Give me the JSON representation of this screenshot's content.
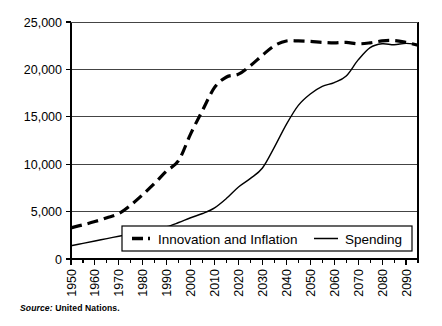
{
  "source_note": {
    "prefix": "Source:",
    "text": "United Nations."
  },
  "colors": {
    "axis": "#000000",
    "grid": "#444444",
    "series_dashed": "#000000",
    "series_solid": "#000000",
    "background": "#ffffff"
  },
  "chart_data": {
    "type": "line",
    "title": "",
    "subtitle": "",
    "xlabel": "",
    "ylabel": "",
    "xlim": [
      1950,
      2095
    ],
    "ylim": [
      0,
      25000
    ],
    "grid": true,
    "grid_axis": "y",
    "legend_position": "inside-bottom-center",
    "y_ticks": [
      0,
      5000,
      10000,
      15000,
      20000,
      25000
    ],
    "y_tick_labels": [
      "0",
      "5,000",
      "10,000",
      "15,000",
      "20,000",
      "25,000"
    ],
    "x_ticks": [
      1950,
      1960,
      1970,
      1980,
      1990,
      2000,
      2010,
      2020,
      2030,
      2040,
      2050,
      2060,
      2070,
      2080,
      2090
    ],
    "x_tick_labels": [
      "1950",
      "1960",
      "1970",
      "1980",
      "1990",
      "2000",
      "2010",
      "2020",
      "2030",
      "2040",
      "2050",
      "2060",
      "2070",
      "2080",
      "2090"
    ],
    "x_minor_tick_interval": 5,
    "x": [
      1950,
      1955,
      1960,
      1965,
      1970,
      1975,
      1980,
      1985,
      1990,
      1995,
      2000,
      2005,
      2010,
      2015,
      2020,
      2025,
      2030,
      2035,
      2040,
      2045,
      2050,
      2055,
      2060,
      2065,
      2070,
      2075,
      2080,
      2085,
      2090,
      2095
    ],
    "series": [
      {
        "name": "Innovation and Inflation",
        "style": "dashed",
        "line_width": 3.2,
        "values": [
          3300,
          3600,
          3950,
          4350,
          4800,
          5700,
          6800,
          8000,
          9300,
          10400,
          13200,
          15700,
          18100,
          19200,
          19500,
          20400,
          21500,
          22500,
          23000,
          23000,
          22950,
          22850,
          22800,
          22850,
          22700,
          22800,
          23000,
          23050,
          22850,
          22550
        ]
      },
      {
        "name": "Spending",
        "style": "solid",
        "line_width": 1.4,
        "values": [
          1400,
          1650,
          1900,
          2150,
          2400,
          2650,
          2900,
          3150,
          3400,
          3850,
          4350,
          4800,
          5400,
          6400,
          7600,
          8500,
          9600,
          11800,
          14200,
          16200,
          17400,
          18200,
          18600,
          19300,
          21000,
          22300,
          22700,
          22600,
          22750,
          22600
        ]
      }
    ],
    "legend": [
      {
        "label": "Innovation and Inflation",
        "style": "dashed"
      },
      {
        "label": "Spending",
        "style": "solid"
      }
    ]
  }
}
